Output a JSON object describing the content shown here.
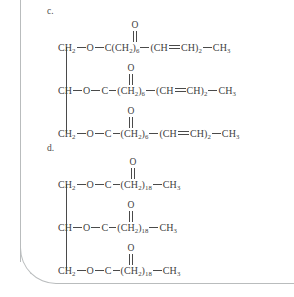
{
  "document": {
    "type": "chemistry-structure-figure",
    "subject": "triglyceride condensed structural formulas"
  },
  "structures": [
    {
      "label": "c.",
      "name": "structure-c",
      "rows": [
        {
          "name": "row-1",
          "head": "CH",
          "head_sub": "2",
          "ester_o": "O",
          "carbonyl_o": "O",
          "carbonyl_c": "C",
          "c_after_dash": false,
          "seg1_open": "(CH",
          "seg1_sub": "2",
          "seg1_close": ")",
          "seg1_count": "6",
          "seg2_open": "(CH",
          "seg2_mid": "CH",
          "seg2_close": ")",
          "seg2_count": "2",
          "tail": "CH",
          "tail_sub": "3"
        },
        {
          "name": "row-2",
          "head": "CH",
          "head_sub": "",
          "ester_o": "O",
          "carbonyl_o": "O",
          "carbonyl_c": "C",
          "c_after_dash": true,
          "seg1_open": "(CH",
          "seg1_sub": "2",
          "seg1_close": ")",
          "seg1_count": "6",
          "seg2_open": "(CH",
          "seg2_mid": "CH",
          "seg2_close": ")",
          "seg2_count": "2",
          "tail": "CH",
          "tail_sub": "3"
        },
        {
          "name": "row-3",
          "head": "CH",
          "head_sub": "2",
          "ester_o": "O",
          "carbonyl_o": "O",
          "carbonyl_c": "C",
          "c_after_dash": true,
          "seg1_open": "(CH",
          "seg1_sub": "2",
          "seg1_close": ")",
          "seg1_count": "6",
          "seg2_open": "(CH",
          "seg2_mid": "CH",
          "seg2_close": ")",
          "seg2_count": "2",
          "tail": "CH",
          "tail_sub": "3"
        }
      ]
    },
    {
      "label": "d.",
      "name": "structure-d",
      "rows": [
        {
          "name": "row-1",
          "head": "CH",
          "head_sub": "2",
          "ester_o": "O",
          "carbonyl_o": "O",
          "carbonyl_c": "C",
          "c_after_dash": true,
          "seg1_open": "(CH",
          "seg1_sub": "2",
          "seg1_close": ")",
          "seg1_count": "18",
          "tail": "CH",
          "tail_sub": "3"
        },
        {
          "name": "row-2",
          "head": "CH",
          "head_sub": "",
          "ester_o": "O",
          "carbonyl_o": "O",
          "carbonyl_c": "C",
          "c_after_dash": true,
          "seg1_open": "(CH",
          "seg1_sub": "2",
          "seg1_close": ")",
          "seg1_count": "18",
          "tail": "CH",
          "tail_sub": "3"
        },
        {
          "name": "row-3",
          "head": "CH",
          "head_sub": "2",
          "ester_o": "O",
          "carbonyl_o": "O",
          "carbonyl_c": "C",
          "c_after_dash": true,
          "seg1_open": "(CH",
          "seg1_sub": "2",
          "seg1_close": ")",
          "seg1_count": "18",
          "tail": "CH",
          "tail_sub": "3"
        }
      ]
    }
  ],
  "colors": {
    "ink": "#414141",
    "bond": "#4a4a4a",
    "frame": "#b9bcbd",
    "background": "#ffffff"
  }
}
